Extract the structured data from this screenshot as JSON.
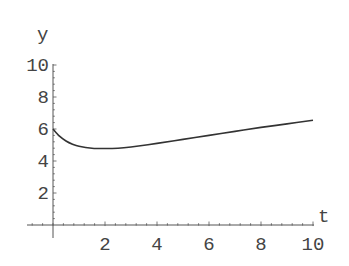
{
  "chart_data": {
    "type": "line",
    "title": "",
    "xlabel": "t",
    "ylabel": "y",
    "xlim": [
      0,
      10
    ],
    "ylim": [
      0,
      10
    ],
    "x_ticks": [
      2,
      4,
      6,
      8,
      10
    ],
    "y_ticks": [
      2,
      4,
      6,
      8,
      10
    ],
    "x_tick_labels": [
      "2",
      "4",
      "6",
      "8",
      "10"
    ],
    "y_tick_labels": [
      "2",
      "4",
      "6",
      "8",
      "10"
    ],
    "grid": false,
    "legend": null,
    "series": [
      {
        "name": "y(t)",
        "color": "#333333",
        "x": [
          0,
          0.25,
          0.5,
          0.75,
          1,
          1.5,
          2,
          2.5,
          3,
          4,
          5,
          6,
          7,
          8,
          9,
          10
        ],
        "y": [
          6.0,
          5.55,
          5.25,
          5.05,
          4.92,
          4.8,
          4.78,
          4.8,
          4.88,
          5.1,
          5.35,
          5.6,
          5.85,
          6.1,
          6.32,
          6.55
        ]
      }
    ]
  },
  "colors": {
    "axis": "#555555",
    "curve": "#333333",
    "text": "#444444",
    "background": "#ffffff"
  }
}
